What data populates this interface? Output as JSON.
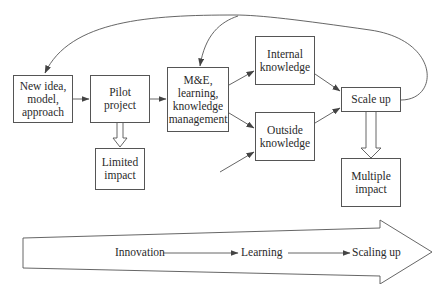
{
  "caption": "",
  "nodes": {
    "new_idea": {
      "label": "New idea, model, approach"
    },
    "pilot": {
      "label": "Pilot project"
    },
    "me_learning": {
      "label": "M&E, learning, knowledge management"
    },
    "internal_knowledge": {
      "label": "Internal knowledge"
    },
    "outside_knowledge": {
      "label": "Outside knowledge"
    },
    "scale_up": {
      "label": "Scale up"
    },
    "limited_impact": {
      "label": "Limited impact"
    },
    "multiple_impact": {
      "label": "Multiple impact"
    }
  },
  "edges": [
    {
      "from": "new_idea",
      "to": "pilot"
    },
    {
      "from": "pilot",
      "to": "me_learning"
    },
    {
      "from": "me_learning",
      "to": "internal_knowledge"
    },
    {
      "from": "me_learning",
      "to": "outside_knowledge"
    },
    {
      "from": "external",
      "to": "outside_knowledge"
    },
    {
      "from": "internal_knowledge",
      "to": "scale_up"
    },
    {
      "from": "outside_knowledge",
      "to": "scale_up"
    },
    {
      "from": "pilot",
      "to": "limited_impact",
      "style": "block-arrow"
    },
    {
      "from": "scale_up",
      "to": "multiple_impact",
      "style": "block-arrow"
    },
    {
      "from": "scale_up",
      "to": "new_idea",
      "style": "feedback-curve"
    },
    {
      "from": "scale_up",
      "to": "me_learning",
      "style": "feedback-curve"
    }
  ],
  "flow": {
    "stages": [
      "Innovation",
      "Learning",
      "Scaling up"
    ]
  },
  "colors": {
    "stroke": "#555555",
    "text": "#2a2a2a",
    "background": "#ffffff"
  }
}
